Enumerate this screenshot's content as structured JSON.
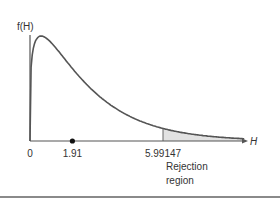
{
  "chart_data": {
    "type": "area",
    "title": "",
    "ylabel": "f(H)",
    "xlabel": "H",
    "distribution": "chi-square",
    "degrees_of_freedom": 2.5,
    "xlim": [
      0,
      12
    ],
    "x_ticks": [
      {
        "value": 0,
        "label": "0"
      },
      {
        "value": 1.91,
        "label": "1.91"
      },
      {
        "value": 5.99147,
        "label": "5.99147"
      }
    ],
    "observed_point": {
      "x": 1.91,
      "label": "1.91"
    },
    "critical_value": 5.99147,
    "shaded_region": {
      "from": 5.99147,
      "to": 12,
      "label": [
        "Rejection",
        "region"
      ],
      "color": "#e2e2e2"
    },
    "curve_color": "#555555",
    "grid": false
  }
}
